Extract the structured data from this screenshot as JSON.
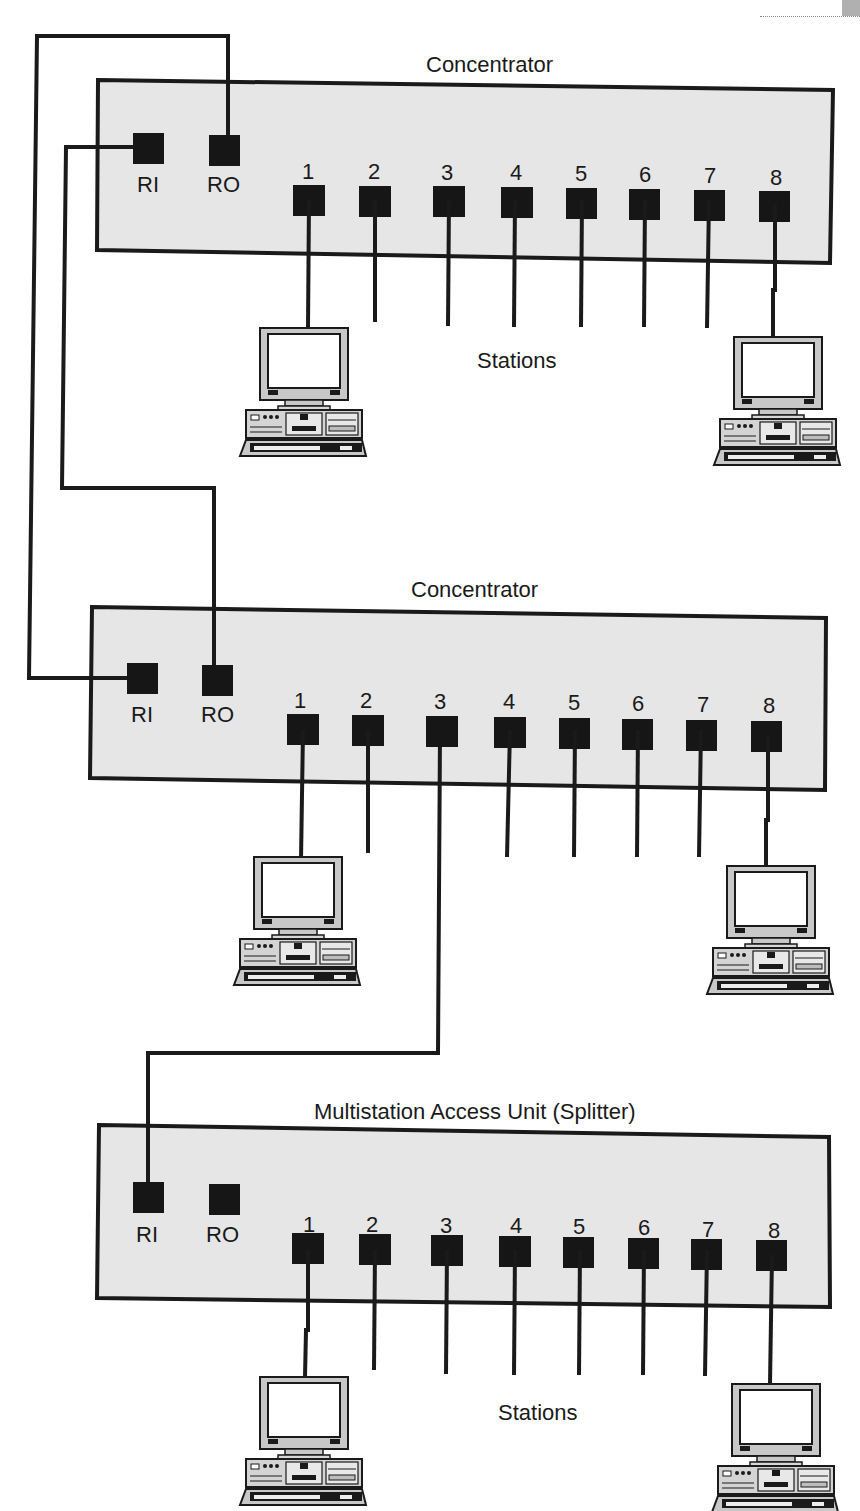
{
  "corner": {
    "partial_text": "3 3 7"
  },
  "units": [
    {
      "title": "Concentrator",
      "ri_label": "RI",
      "ro_label": "RO",
      "ports": [
        "1",
        "2",
        "3",
        "4",
        "5",
        "6",
        "7",
        "8"
      ]
    },
    {
      "title": "Concentrator",
      "ri_label": "RI",
      "ro_label": "RO",
      "ports": [
        "1",
        "2",
        "3",
        "4",
        "5",
        "6",
        "7",
        "8"
      ]
    },
    {
      "title": "Multistation Access Unit (Splitter)",
      "ri_label": "RI",
      "ro_label": "RO",
      "ports": [
        "1",
        "2",
        "3",
        "4",
        "5",
        "6",
        "7",
        "8"
      ]
    }
  ],
  "station_labels": [
    "Stations",
    "Stations"
  ],
  "colors": {
    "box_fill": "#e6e6e6",
    "line": "#1a1a1a",
    "port": "#161616",
    "background": "#ffffff"
  },
  "icons": {
    "station": "desktop-computer-icon"
  }
}
